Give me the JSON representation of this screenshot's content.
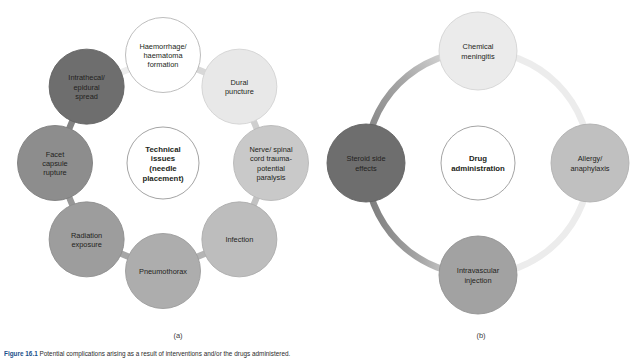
{
  "figure": {
    "panel_letters": {
      "a": "(a)",
      "b": "(b)"
    },
    "caption_prefix": "Figure 16.1",
    "caption_text": "Potential complications arising as a result of interventions and/or the drugs administered."
  },
  "diagram_a": {
    "id": "technical-issues-cycle",
    "type": "cycle",
    "center": {
      "label": "Technical issues (needle placement)",
      "lines": [
        "Technical",
        "issues",
        "(needle",
        "placement)"
      ],
      "fill": "#ffffff",
      "stroke": "#9a9a9a"
    },
    "nodes": [
      {
        "label": "Haemorrhage/ haematoma formation",
        "lines": [
          "Haemorrhage/",
          "haematoma",
          "formation"
        ],
        "fill": "#ffffff",
        "stroke": "#b5b5b5"
      },
      {
        "label": "Dural puncture",
        "lines": [
          "Dural",
          "puncture"
        ],
        "fill": "#e8e8e8",
        "stroke": "#d2d2d2"
      },
      {
        "label": "Nerve/ spinal cord trauma- potential paralysis",
        "lines": [
          "Nerve/ spinal",
          "cord trauma-",
          "potential",
          "paralysis"
        ],
        "fill": "#c9c9c9",
        "stroke": "#b8b8b8"
      },
      {
        "label": "Infection",
        "lines": [
          "Infection"
        ],
        "fill": "#bdbdbd",
        "stroke": "#ababab"
      },
      {
        "label": "Pneumothorax",
        "lines": [
          "Pneumothorax"
        ],
        "fill": "#adadad",
        "stroke": "#9c9c9c"
      },
      {
        "label": "Radiation exposure",
        "lines": [
          "Radiation",
          "exposure"
        ],
        "fill": "#9d9d9d",
        "stroke": "#8d8d8d"
      },
      {
        "label": "Facet capsule rupture",
        "lines": [
          "Facet",
          "capsule",
          "rupture"
        ],
        "fill": "#8d8d8d",
        "stroke": "#7e7e7e"
      },
      {
        "label": "Intrathecal/ epidural spread",
        "lines": [
          "Intrathecal/",
          "epidural",
          "spread"
        ],
        "fill": "#6e6e6e",
        "stroke": "#626262"
      }
    ],
    "connector_colors": [
      "#d8d8d8",
      "#cfcfcf",
      "#c2c2c2",
      "#b4b4b4",
      "#a6a6a6",
      "#979797",
      "#838383",
      "#ededed"
    ]
  },
  "diagram_b": {
    "id": "drug-administration-cycle",
    "type": "cycle",
    "center": {
      "label": "Drug administration",
      "lines": [
        "Drug",
        "administration"
      ],
      "fill": "#ffffff",
      "stroke": "#9a9a9a"
    },
    "nodes": [
      {
        "label": "Chemical meningitis",
        "lines": [
          "Chemical",
          "meningitis"
        ],
        "fill": "#ebebeb",
        "stroke": "#d4d4d4"
      },
      {
        "label": "Allergy/ anaphylaxis",
        "lines": [
          "Allergy/",
          "anaphylaxis"
        ],
        "fill": "#c0c0c0",
        "stroke": "#b0b0b0"
      },
      {
        "label": "Intravascular injection",
        "lines": [
          "Intravascular",
          "injection"
        ],
        "fill": "#a2a2a2",
        "stroke": "#929292"
      },
      {
        "label": "Steroid side effects",
        "lines": [
          "Steroid side",
          "effects"
        ],
        "fill": "#6e6e6e",
        "stroke": "#626262"
      }
    ],
    "ring_gradient": {
      "dark": "#7a7a7a",
      "mid": "#a8a8a8",
      "light": "#ececec"
    }
  },
  "colors": {
    "text": "#231f20",
    "caption_accent": "#1b4f8a",
    "background": "#ffffff"
  }
}
